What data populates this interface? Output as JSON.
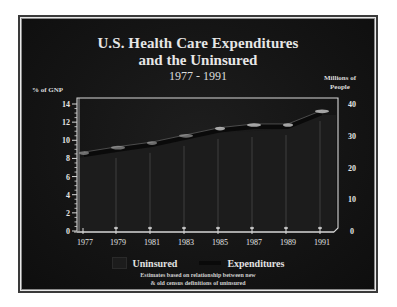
{
  "chart_data": {
    "type": "area",
    "title": "U.S. Health Care Expenditures",
    "subtitle": "and the Uninsured",
    "period": "1977 - 1991",
    "xlabel": "",
    "ylabel_left": "% of GNP",
    "ylabel_right": "Millions of People",
    "categories": [
      "1977",
      "1979",
      "1981",
      "1983",
      "1985",
      "1987",
      "1989",
      "1991"
    ],
    "y_left_ticks": [
      0,
      2,
      4,
      6,
      8,
      10,
      12,
      14
    ],
    "y_right_ticks": [
      0,
      10,
      20,
      30,
      40
    ],
    "ylim_left": [
      0,
      14
    ],
    "ylim_right": [
      0,
      40
    ],
    "series": [
      {
        "name": "Uninsured",
        "axis": "right",
        "type": "area",
        "unit": "Millions of People",
        "values": [
          23.3,
          24.9,
          26.5,
          28.7,
          30.9,
          31.5,
          32.1,
          36.5
        ]
      },
      {
        "name": "Expenditures",
        "axis": "left",
        "type": "line",
        "unit": "% of GNP",
        "values": [
          8.7,
          9.3,
          9.8,
          10.6,
          11.4,
          11.8,
          11.8,
          13.3
        ]
      }
    ],
    "legend": [
      "Uninsured",
      "Expenditures"
    ],
    "legend_position": "bottom",
    "grid": false,
    "footnote": [
      "Estimates based on relationship between new",
      "& old census definitions of uninsured"
    ]
  },
  "header": {
    "title_line1": "U.S. Health Care Expenditures",
    "title_line2": "and the Uninsured",
    "title_line3": "1977 - 1991"
  },
  "axes": {
    "left_label": "% of GNP",
    "right_label_line1": "Millions of",
    "right_label_line2": "People"
  },
  "legend": {
    "uninsured": "Uninsured",
    "expenditures": "Expenditures"
  },
  "footnote": {
    "line1": "Estimates based on relationship between new",
    "line2": "& old census definitions of uninsured"
  },
  "colors": {
    "background": "#141414",
    "text": "#e6e6e6",
    "axis": "#d8d8d8",
    "area_fill": "#1c1c1c",
    "ribbon": "#0a0a0a",
    "highlight": "#bdbdbd"
  }
}
